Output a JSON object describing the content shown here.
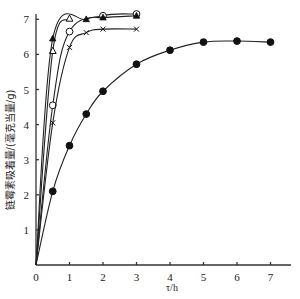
{
  "chart_data": {
    "type": "line",
    "title": "",
    "xlabel": "τ/h",
    "ylabel": "链霉素吸着量/(毫克当量/g)",
    "xlim": [
      0,
      7.6
    ],
    "ylim": [
      0,
      7.3
    ],
    "xticks": [
      0,
      1,
      2,
      3,
      4,
      5,
      6,
      7
    ],
    "yticks": [
      1,
      2,
      3,
      4,
      5,
      6,
      7
    ],
    "grid": false,
    "legend": null,
    "series": [
      {
        "name": "filled-circle",
        "marker": "filled-circle",
        "x": [
          0,
          0.5,
          1,
          1.5,
          2,
          3,
          4,
          5,
          6,
          7
        ],
        "y": [
          0,
          2.1,
          3.4,
          4.3,
          4.95,
          5.72,
          6.12,
          6.35,
          6.38,
          6.35
        ]
      },
      {
        "name": "open-circle",
        "marker": "open-circle",
        "x": [
          0,
          0.5,
          1,
          2,
          3
        ],
        "y": [
          0,
          4.55,
          6.65,
          7.1,
          7.15
        ]
      },
      {
        "name": "cross",
        "marker": "cross",
        "x": [
          0,
          0.5,
          1,
          1.5,
          2,
          3
        ],
        "y": [
          0,
          4.05,
          6.2,
          6.62,
          6.72,
          6.72
        ]
      },
      {
        "name": "open-triangle",
        "marker": "open-triangle",
        "x": [
          0,
          0.5,
          1
        ],
        "y": [
          0,
          6.1,
          7.02
        ]
      },
      {
        "name": "filled-triangle",
        "marker": "filled-triangle",
        "x": [
          0,
          0.5,
          1.5,
          2,
          3
        ],
        "y": [
          0,
          6.45,
          7.0,
          7.05,
          7.1
        ]
      }
    ]
  }
}
